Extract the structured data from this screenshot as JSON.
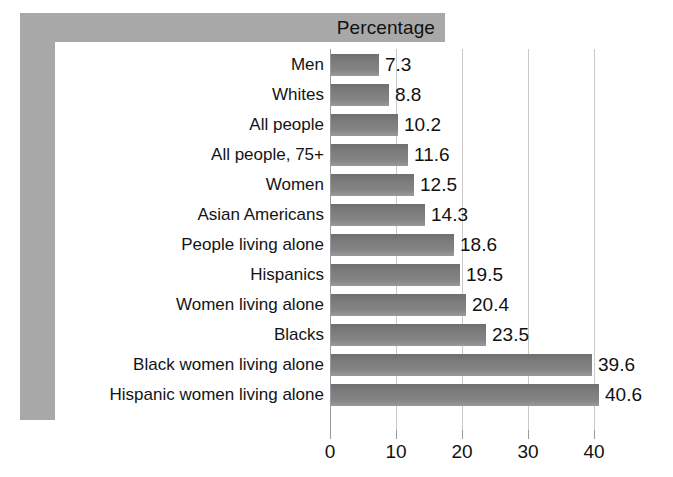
{
  "chart_data": {
    "type": "bar",
    "orientation": "horizontal",
    "title": "Percentage",
    "xlabel": "",
    "ylabel": "",
    "xlim": [
      0,
      41.5
    ],
    "xticks": [
      0,
      10,
      20,
      30,
      40
    ],
    "xticklabels": [
      "0",
      "10",
      "20",
      "30",
      "40"
    ],
    "grid": "vertical",
    "legend": "none",
    "categories": [
      "Men",
      "Whites",
      "All people",
      "All people, 75+",
      "Women",
      "Asian Americans",
      "People living alone",
      "Hispanics",
      "Women living alone",
      "Blacks",
      "Black women living alone",
      "Hispanic women living alone"
    ],
    "values": [
      7.3,
      8.8,
      10.2,
      11.6,
      12.5,
      14.3,
      18.6,
      19.5,
      20.4,
      23.5,
      39.6,
      40.6
    ],
    "value_labels": [
      "7.3",
      "8.8",
      "10.2",
      "11.6",
      "12.5",
      "14.3",
      "18.6",
      "19.5",
      "20.4",
      "23.5",
      "39.6",
      "40.6"
    ],
    "bar_color": "#7c7c7c",
    "frame_color": "#a8a8a8",
    "gridline_color": "#c9c9c9",
    "background_color": "#ffffff"
  }
}
